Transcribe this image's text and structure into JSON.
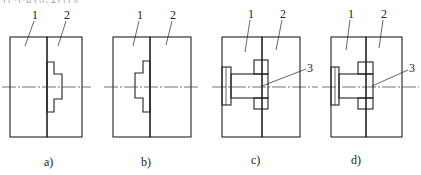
{
  "header": {
    "partial_text": "件中的密封件。"
  },
  "parts": {
    "part_1": "1",
    "part_2": "2",
    "part_3": "3"
  },
  "panels": [
    {
      "id": "a",
      "caption": "a)",
      "has_pin": false,
      "seal_side": "part_2"
    },
    {
      "id": "b",
      "caption": "b)",
      "has_pin": false,
      "seal_side": "part_1"
    },
    {
      "id": "c",
      "caption": "c)",
      "has_pin": true,
      "seal_side": "joint"
    },
    {
      "id": "d",
      "caption": "d)",
      "has_pin": true,
      "seal_side": "joint"
    }
  ],
  "colors": {
    "line": "#222222",
    "background": "#ffffff"
  }
}
